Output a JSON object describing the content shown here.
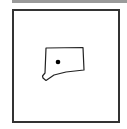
{
  "map": {
    "region_name": "Connecticut",
    "marker": {
      "label": "capital",
      "color": "#000000"
    },
    "outline_color": "#222222",
    "frame_color": "#333333",
    "top_bar_color": "#9a9a9a"
  }
}
